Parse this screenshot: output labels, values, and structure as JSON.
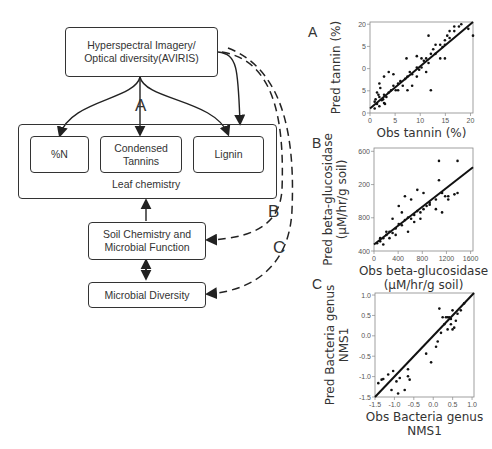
{
  "diagram": {
    "top_box": {
      "line1": "Hyperspectral Imagery/",
      "line2": "Optical diversity(AVIRIS)"
    },
    "leaf_chemistry": {
      "label": "Leaf chemistry",
      "items": [
        {
          "line1": "%N",
          "line2": ""
        },
        {
          "line1": "Condensed",
          "line2": "Tannins"
        },
        {
          "line1": "Lignin",
          "line2": ""
        }
      ]
    },
    "soil_box": {
      "line1": "Soil Chemistry and",
      "line2": "Microbial Function"
    },
    "microbial_box": {
      "label": "Microbial Diversity"
    },
    "path_labels": {
      "a": "A",
      "b": "B",
      "c": "C"
    }
  },
  "chart_data": [
    {
      "panel": "A",
      "type": "scatter",
      "xlabel": "Obs tannin (%)",
      "ylabel": "Pred tannin (%)",
      "xticks": [
        "0",
        "5",
        "10",
        "15",
        "20"
      ],
      "yticks": [
        "0",
        "5",
        "0",
        "5",
        "20"
      ],
      "xlim": [
        0,
        22
      ],
      "ylim": [
        0,
        20
      ],
      "fit_line": [
        [
          0,
          1
        ],
        [
          22,
          20
        ]
      ],
      "points": [
        [
          1,
          1
        ],
        [
          1.5,
          2
        ],
        [
          2,
          1.5
        ],
        [
          1.2,
          3
        ],
        [
          2.5,
          2.8
        ],
        [
          3,
          2.2
        ],
        [
          1.8,
          4
        ],
        [
          2.2,
          5.5
        ],
        [
          3,
          4
        ],
        [
          3.5,
          3.5
        ],
        [
          4,
          4.5
        ],
        [
          4.5,
          5
        ],
        [
          5,
          6
        ],
        [
          5.5,
          5
        ],
        [
          6,
          6.5
        ],
        [
          6.5,
          7
        ],
        [
          7,
          6
        ],
        [
          7.5,
          7.5
        ],
        [
          8,
          8
        ],
        [
          8.5,
          9
        ],
        [
          9,
          8.5
        ],
        [
          10,
          10
        ],
        [
          10.5,
          9.5
        ],
        [
          11,
          10
        ],
        [
          11.5,
          11.5
        ],
        [
          12,
          12
        ],
        [
          12.5,
          11
        ],
        [
          13,
          13
        ],
        [
          13.5,
          14
        ],
        [
          14,
          13
        ],
        [
          15,
          15
        ],
        [
          15.5,
          14.5
        ],
        [
          16,
          16
        ],
        [
          16.5,
          17
        ],
        [
          17,
          16.5
        ],
        [
          18,
          18
        ],
        [
          19.5,
          19.5
        ],
        [
          21,
          18.5
        ],
        [
          22,
          17
        ],
        [
          4,
          9
        ],
        [
          5,
          8.5
        ],
        [
          7.8,
          12
        ],
        [
          10,
          12.5
        ],
        [
          11,
          12
        ],
        [
          12.5,
          17
        ],
        [
          13,
          5
        ],
        [
          15,
          12
        ],
        [
          16,
          12
        ],
        [
          17,
          18
        ],
        [
          19,
          19
        ],
        [
          9,
          6
        ],
        [
          6,
          5
        ],
        [
          3,
          8
        ],
        [
          2,
          6.5
        ],
        [
          1.5,
          4.5
        ],
        [
          2.8,
          3
        ],
        [
          3.2,
          2
        ],
        [
          1,
          2.5
        ],
        [
          2,
          3.5
        ],
        [
          8,
          5
        ],
        [
          10,
          8
        ],
        [
          12,
          9
        ],
        [
          14,
          15
        ],
        [
          18,
          19
        ],
        [
          16,
          15
        ]
      ]
    },
    {
      "panel": "B",
      "type": "scatter",
      "xlabel": "Obs beta-glucosidase (µM/hr/g soil)",
      "ylabel": "Pred beta-glucosidase (µM/hr/g soil)",
      "xticks": [
        "0",
        "400",
        "800",
        "1200",
        "1600"
      ],
      "yticks": [
        "400",
        "800",
        "200",
        "600"
      ],
      "xlim": [
        0,
        1600
      ],
      "ylim": [
        0,
        1600
      ],
      "fit_line": [
        [
          0,
          100
        ],
        [
          1600,
          1300
        ]
      ],
      "points": [
        [
          50,
          120
        ],
        [
          100,
          150
        ],
        [
          150,
          200
        ],
        [
          200,
          250
        ],
        [
          250,
          300
        ],
        [
          300,
          280
        ],
        [
          350,
          350
        ],
        [
          400,
          420
        ],
        [
          450,
          400
        ],
        [
          500,
          480
        ],
        [
          550,
          520
        ],
        [
          600,
          500
        ],
        [
          650,
          560
        ],
        [
          700,
          620
        ],
        [
          750,
          600
        ],
        [
          800,
          650
        ],
        [
          850,
          700
        ],
        [
          900,
          720
        ],
        [
          1000,
          800
        ],
        [
          1100,
          900
        ],
        [
          1200,
          850
        ],
        [
          1300,
          880
        ],
        [
          1050,
          1400
        ],
        [
          1350,
          1400
        ],
        [
          1050,
          1100
        ],
        [
          1350,
          900
        ],
        [
          500,
          850
        ],
        [
          400,
          700
        ],
        [
          300,
          500
        ],
        [
          200,
          300
        ],
        [
          250,
          200
        ],
        [
          350,
          250
        ],
        [
          150,
          100
        ],
        [
          100,
          200
        ],
        [
          450,
          600
        ],
        [
          600,
          800
        ],
        [
          700,
          950
        ],
        [
          800,
          900
        ],
        [
          900,
          750
        ],
        [
          1150,
          850
        ],
        [
          1200,
          800
        ],
        [
          1000,
          650
        ],
        [
          1100,
          600
        ],
        [
          550,
          300
        ],
        [
          650,
          450
        ],
        [
          750,
          500
        ]
      ]
    },
    {
      "panel": "C",
      "type": "scatter",
      "xlabel": "Obs Bacteria genus NMS1",
      "ylabel": "Pred Bacteria genus NMS1",
      "xticks": [
        "-1.5",
        "-1.0",
        "-0.5",
        "0.0",
        "0.5",
        "1.0"
      ],
      "yticks": [
        "-1.5",
        "-1.0",
        "-0.5",
        "0.0",
        "0.5",
        "1.0"
      ],
      "xlim": [
        -1.5,
        1.5
      ],
      "ylim": [
        -1.5,
        1.5
      ],
      "fit_line": [
        [
          -1.5,
          -1.5
        ],
        [
          1.5,
          1.5
        ]
      ],
      "points": [
        [
          -1.4,
          -1.1
        ],
        [
          -1.3,
          -1.0
        ],
        [
          -1.25,
          -0.98
        ],
        [
          -1.1,
          -0.85
        ],
        [
          -0.95,
          -0.75
        ],
        [
          -1.0,
          -1.3
        ],
        [
          -0.85,
          -1.05
        ],
        [
          -0.75,
          -0.95
        ],
        [
          -0.8,
          -1.4
        ],
        [
          -0.6,
          -1.3
        ],
        [
          -0.5,
          -0.9
        ],
        [
          -0.5,
          -0.7
        ],
        [
          -0.45,
          -1.0
        ],
        [
          0.05,
          -0.25
        ],
        [
          0.2,
          -0.5
        ],
        [
          0.35,
          -0.05
        ],
        [
          0.4,
          0.1
        ],
        [
          0.45,
          1.05
        ],
        [
          0.5,
          0.35
        ],
        [
          0.55,
          0.8
        ],
        [
          0.6,
          0.6
        ],
        [
          0.65,
          0.8
        ],
        [
          0.7,
          0.8
        ],
        [
          0.75,
          0.8
        ],
        [
          0.8,
          0.6
        ],
        [
          0.85,
          1.0
        ],
        [
          0.85,
          0.45
        ],
        [
          0.9,
          0.5
        ],
        [
          0.95,
          0.7
        ],
        [
          1.0,
          0.9
        ],
        [
          1.1,
          1.0
        ],
        [
          1.2,
          1.2
        ],
        [
          0.7,
          0.45
        ],
        [
          0.8,
          0.75
        ]
      ]
    }
  ]
}
